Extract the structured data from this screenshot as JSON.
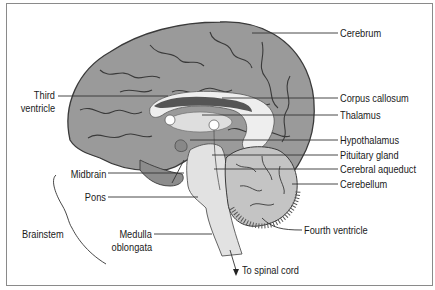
{
  "diagram": {
    "type": "anatomical-cross-section",
    "labels": {
      "cerebrum": "Cerebrum",
      "corpus_callosum": "Corpus callosum",
      "thalamus": "Thalamus",
      "hypothalamus": "Hypothalamus",
      "pituitary_gland": "Pituitary gland",
      "cerebral_aqueduct": "Cerebral aqueduct",
      "cerebellum": "Cerebellum",
      "fourth_ventricle": "Fourth ventricle",
      "to_spinal_cord": "To spinal cord",
      "third_ventricle_line1": "Third",
      "third_ventricle_line2": "ventricle",
      "midbrain": "Midbrain",
      "pons": "Pons",
      "medulla_line1": "Medulla",
      "medulla_line2": "oblongata",
      "brainstem": "Brainstem"
    },
    "colors": {
      "cortex": "#9a9a9a",
      "cortex_dark": "#6e6e6e",
      "sulci": "#3a3a3a",
      "white_matter": "#e6e6e6",
      "ventricle": "#555555",
      "brainstem": "#e2e2e2",
      "cerebellum": "#c4c4c4",
      "leader_line": "#333333",
      "border": "#8a8a8a"
    }
  }
}
